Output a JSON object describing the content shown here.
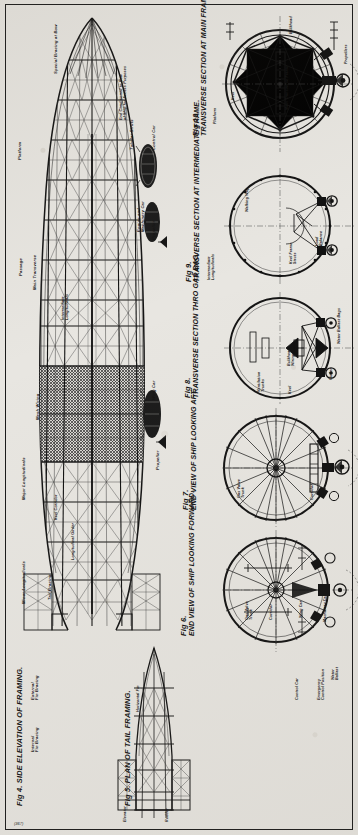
{
  "plate": {
    "corner_note": "(367)",
    "background_color": "#e8e6e1",
    "ink_color": "#141414"
  },
  "figures": [
    {
      "id": "fig4",
      "number": "Fig 4.",
      "title": "SIDE ELEVATION OF FRAMING.",
      "labels": [
        "Special Bracing at Bow",
        "End Conditioned to Bow of Ship for Access Purposes",
        "Platform",
        "Tubular Struts",
        "Control Car",
        "Engine and Machinery Car",
        "Propeller",
        "Passage",
        "Main Transverse",
        "Intermediate Longitudinals",
        "Mesh Wiring",
        "Wing Car",
        "Propeller",
        "Major Longitudinals",
        "Keel Corridor",
        "Longitudinal Girder",
        "Minor Longitudinals",
        "Tail Bracing"
      ]
    },
    {
      "id": "fig5",
      "number": "Fig 5.",
      "title": "PLAN OF TAIL FRAMING.",
      "labels": [
        "Horizontal Fin",
        "Elevator",
        "Rudder"
      ]
    },
    {
      "id": "fig6",
      "number": "Fig 6.",
      "title": "END VIEW OF SHIP LOOKING FORWARD.",
      "labels": [
        "Gas Valve Trunk",
        "Corridor",
        "Wing Car",
        "Machinery Car",
        "Water Ballast",
        "Emergency Control Position",
        "Control Car"
      ]
    },
    {
      "id": "fig7",
      "number": "Fig 7.",
      "title": "END VIEW OF SHIP LOOKING AFT.",
      "labels": [
        "Gas Valve Trunk",
        "Mooring Gear",
        "Wing Car",
        "Corridor"
      ]
    },
    {
      "id": "fig8",
      "number": "Fig 8.",
      "title": "TRANSVERSE SECTION THRO GAS BAG.",
      "labels": [
        "Ventilation Trunks",
        "Bulkhead Wiring",
        "Keel",
        "Girder",
        "Water Ballast Bags"
      ]
    },
    {
      "id": "fig9",
      "number": "Fig 9.",
      "title": "TRANSVERSE SECTION AT INTERMEDIATE FRAME.",
      "labels": [
        "Intermediate Longitudinals",
        "Keel Frame Struts",
        "Load Balance",
        "Walking Way"
      ]
    },
    {
      "id": "fig10",
      "number": "Fig 10.",
      "title": "TRANSVERSE SECTION AT MAIN FRAME.",
      "labels": [
        "Bulkhead",
        "Platform",
        "Propellers",
        "Keel",
        "Main Transverse Frame",
        "Wing Car"
      ]
    }
  ]
}
